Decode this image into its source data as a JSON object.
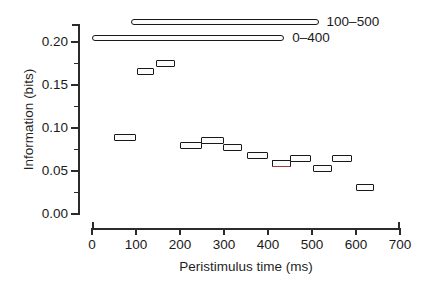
{
  "chart_data": {
    "type": "bar",
    "title": "",
    "xlabel": "Peristimulus time (ms)",
    "ylabel": "Information (bits)",
    "xlim": [
      0,
      700
    ],
    "ylim": [
      0.0,
      0.225
    ],
    "grid": false,
    "legend_position": "top-right",
    "x_ticks": [
      {
        "value": 0,
        "label": "0"
      },
      {
        "value": 100,
        "label": "100"
      },
      {
        "value": 200,
        "label": "200"
      },
      {
        "value": 300,
        "label": "300"
      },
      {
        "value": 400,
        "label": "400"
      },
      {
        "value": 500,
        "label": "500"
      },
      {
        "value": 600,
        "label": "600"
      },
      {
        "value": 700,
        "label": "700"
      }
    ],
    "y_ticks": [
      {
        "value": 0.0,
        "label": "0.00"
      },
      {
        "value": 0.05,
        "label": "0.05"
      },
      {
        "value": 0.1,
        "label": "0.10"
      },
      {
        "value": 0.15,
        "label": "0.15"
      },
      {
        "value": 0.2,
        "label": "0.20"
      }
    ],
    "y_minor_ticks": [
      0.025,
      0.075,
      0.125,
      0.175,
      0.225
    ],
    "bars": [
      {
        "x_start": 50,
        "x_end": 100,
        "value": 0.0885,
        "accent": false
      },
      {
        "x_start": 102,
        "x_end": 142,
        "value": 0.166,
        "accent": false
      },
      {
        "x_start": 145,
        "x_end": 188,
        "value": 0.175,
        "accent": false
      },
      {
        "x_start": 200,
        "x_end": 250,
        "value": 0.08,
        "accent": false
      },
      {
        "x_start": 248,
        "x_end": 300,
        "value": 0.0855,
        "accent": false
      },
      {
        "x_start": 298,
        "x_end": 340,
        "value": 0.077,
        "accent": false
      },
      {
        "x_start": 352,
        "x_end": 400,
        "value": 0.068,
        "accent": false
      },
      {
        "x_start": 408,
        "x_end": 452,
        "value": 0.0588,
        "accent": true
      },
      {
        "x_start": 450,
        "x_end": 497,
        "value": 0.064,
        "accent": false
      },
      {
        "x_start": 503,
        "x_end": 545,
        "value": 0.0525,
        "accent": false
      },
      {
        "x_start": 545,
        "x_end": 590,
        "value": 0.0645,
        "accent": false
      },
      {
        "x_start": 600,
        "x_end": 642,
        "value": 0.031,
        "accent": false
      }
    ],
    "span_bars": [
      {
        "label": "100–500",
        "x_start": 88,
        "x_end": 515,
        "value": 0.2235
      },
      {
        "label": "0–400",
        "x_start": 0,
        "x_end": 437,
        "value": 0.205
      }
    ]
  }
}
